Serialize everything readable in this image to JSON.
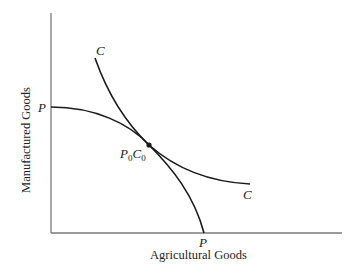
{
  "diagram": {
    "type": "production-possibility-frontier with community indifference curve",
    "axes": {
      "x_label": "Agricultural Goods",
      "y_label": "Manufactured Goods"
    },
    "curves": [
      {
        "id": "ppf",
        "label_start": "P",
        "label_end": "P",
        "description": "Production possibility frontier, concave to origin"
      },
      {
        "id": "indifference",
        "label_start": "C",
        "label_end": "C",
        "description": "Community indifference curve, convex to origin"
      }
    ],
    "tangency_point": {
      "label_main1": "P",
      "label_sub1": "0",
      "label_main2": "C",
      "label_sub2": "0"
    },
    "colors": {
      "curve": "#1a1a1a",
      "axis": "#7a7a7a",
      "text": "#1a1a1a"
    }
  }
}
